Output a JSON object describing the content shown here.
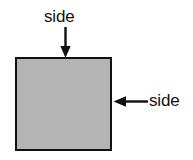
{
  "diagram": {
    "background_color": "#ffffff",
    "shape": {
      "name": "square",
      "fill_color": "#b4b4b4",
      "border_color": "#111111"
    },
    "labels": {
      "top": "side",
      "right": "side"
    },
    "arrows": {
      "top": "arrow-down-icon",
      "right": "arrow-left-icon"
    }
  }
}
